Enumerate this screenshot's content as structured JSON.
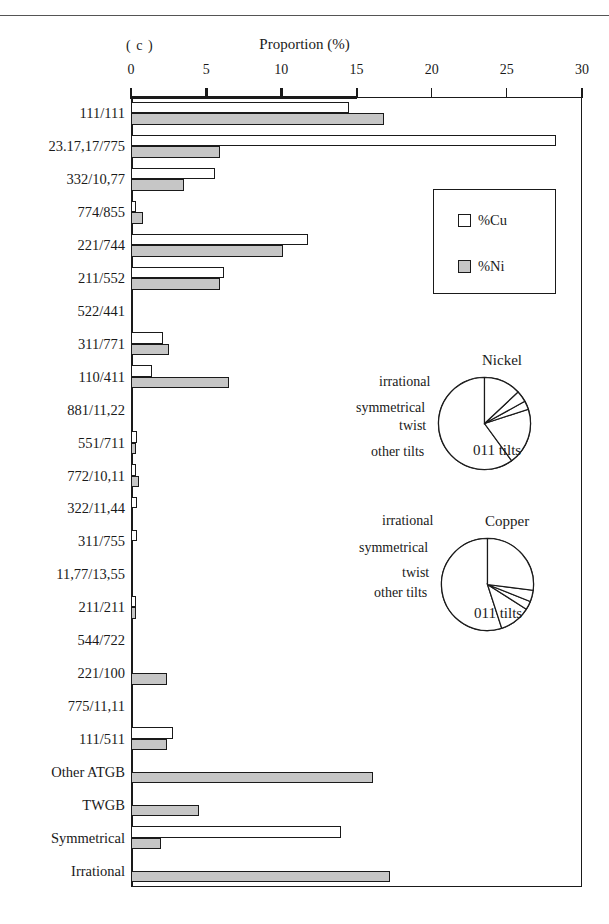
{
  "panel": {
    "tag": "( c )"
  },
  "axis": {
    "title": "Proportion (%)",
    "ticks": [
      0,
      5,
      10,
      15,
      20,
      25,
      30
    ],
    "tick_labels": [
      "0",
      "5",
      "10",
      "15",
      "20",
      "25",
      "30"
    ],
    "min": 0,
    "max": 30
  },
  "legend": {
    "items": [
      {
        "label": "%Cu",
        "swatch": "white"
      },
      {
        "label": "%Ni",
        "swatch": "gray"
      }
    ]
  },
  "colors": {
    "cu_fill": "#ffffff",
    "ni_fill": "#c6c6c6",
    "stroke": "#1a1a1a"
  },
  "pies": [
    {
      "title": "Nickel",
      "slices": [
        {
          "label": "011 tilts",
          "value": 60
        },
        {
          "label": "other tilts",
          "value": 20
        },
        {
          "label": "twist",
          "value": 3
        },
        {
          "label": "symmetrical",
          "value": 4
        },
        {
          "label": "irrational",
          "value": 13
        }
      ]
    },
    {
      "title": "Copper",
      "slices": [
        {
          "label": "011 tilts",
          "value": 55
        },
        {
          "label": "other tilts",
          "value": 11
        },
        {
          "label": "twist",
          "value": 3
        },
        {
          "label": "symmetrical",
          "value": 4
        },
        {
          "label": "irrational",
          "value": 27
        }
      ]
    }
  ],
  "chart_data": {
    "type": "bar",
    "title": "Proportion (%)",
    "subtitle": "( c )",
    "orientation": "horizontal",
    "xlabel": "Proportion (%)",
    "ylabel": "",
    "xlim": [
      0,
      30
    ],
    "grid": false,
    "legend_position": "right-top",
    "categories": [
      "111/111",
      "23.17,17/775",
      "332/10,77",
      "774/855",
      "221/744",
      "211/552",
      "522/441",
      "311/771",
      "110/411",
      "881/11,22",
      "551/711",
      "772/10,11",
      "322/11,44",
      "311/755",
      "11,77/13,55",
      "211/211",
      "544/722",
      "221/100",
      "775/11,11",
      "111/511",
      "Other ATGB",
      "TWGB",
      "Symmetrical",
      "Irrational"
    ],
    "series": [
      {
        "name": "%Cu",
        "values": [
          14.5,
          28.3,
          5.6,
          0.3,
          11.8,
          6.2,
          0.0,
          2.1,
          1.4,
          0.0,
          0.4,
          0.3,
          0.4,
          0.4,
          0.0,
          0.35,
          0.0,
          0.0,
          0.0,
          2.8,
          0.0,
          0.0,
          14.0,
          0.0
        ]
      },
      {
        "name": "%Ni",
        "values": [
          16.8,
          5.9,
          3.5,
          0.8,
          10.1,
          5.9,
          0.0,
          2.5,
          6.5,
          0.0,
          0.35,
          0.55,
          0.0,
          0.0,
          0.0,
          0.3,
          0.0,
          2.4,
          0.0,
          2.4,
          16.1,
          4.5,
          2.0,
          17.2
        ]
      }
    ],
    "pies": [
      {
        "title": "Nickel",
        "type": "pie",
        "labels": [
          "011 tilts",
          "other tilts",
          "twist",
          "symmetrical",
          "irrational"
        ],
        "values": [
          60,
          20,
          3,
          4,
          13
        ]
      },
      {
        "title": "Copper",
        "type": "pie",
        "labels": [
          "011 tilts",
          "other tilts",
          "twist",
          "symmetrical",
          "irrational"
        ],
        "values": [
          55,
          11,
          3,
          4,
          27
        ]
      }
    ]
  }
}
